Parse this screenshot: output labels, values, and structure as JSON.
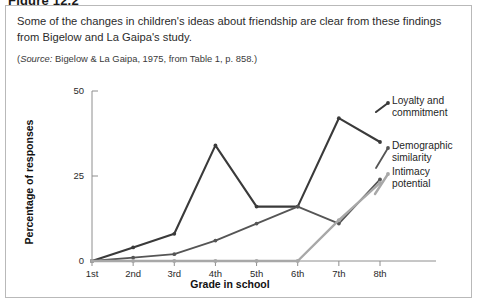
{
  "figure": {
    "title": "Figure 12.2"
  },
  "caption": {
    "text": "Some of the changes in children's ideas about friendship are clear from these findings from Bigelow and La Gaipa's study.",
    "source_prefix": "Source:",
    "source_rest": " Bigelow & La Gaipa, 1975, from Table 1, p. 858.)",
    "source_open": "("
  },
  "chart_data": {
    "type": "line",
    "title": "",
    "xlabel": "Grade in school",
    "ylabel": "Percentage of responses",
    "categories": [
      "1st",
      "2nd",
      "3rd",
      "4th",
      "5th",
      "6th",
      "7th",
      "8th"
    ],
    "ylim": [
      0,
      50
    ],
    "yticks": [
      0,
      25,
      50
    ],
    "ytick_labels": [
      "0",
      "25",
      "50"
    ],
    "grid": false,
    "legend_position": "right",
    "series": [
      {
        "name": "Loyalty and commitment",
        "label_line1": "Loyalty and",
        "label_line2": "commitment",
        "color": "#3a3a3a",
        "width": 2.1,
        "values": [
          0,
          4,
          8,
          34,
          16,
          16,
          42,
          35
        ]
      },
      {
        "name": "Demographic similarity",
        "label_line1": "Demographic",
        "label_line2": "similarity",
        "color": "#555555",
        "width": 1.8,
        "values": [
          0,
          1,
          2,
          6,
          11,
          16,
          11,
          24
        ]
      },
      {
        "name": "Intimacy potential",
        "label_line1": "Intimacy",
        "label_line2": "potential",
        "color": "#a8a8a8",
        "width": 2.4,
        "values": [
          0,
          0,
          0,
          0,
          0,
          0,
          12,
          23
        ]
      }
    ]
  }
}
